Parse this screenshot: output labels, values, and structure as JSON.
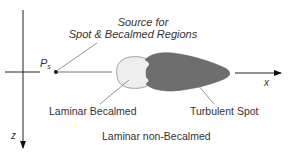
{
  "diagram": {
    "source_label_line1": "Source for",
    "source_label_line2": "Spot & Becalmed Regions",
    "point_label": "P",
    "point_subscript": "s",
    "x_axis_label": "x",
    "z_axis_label": "z",
    "becalmed_label": "Laminar Becalmed",
    "spot_label": "Turbulent Spot",
    "non_becalmed_label": "Laminar non-Becalmed",
    "colors": {
      "becalmed_fill": "#eeeeee",
      "spot_fill": "#6e6e6e",
      "line": "#222222",
      "outline": "#999999"
    }
  }
}
